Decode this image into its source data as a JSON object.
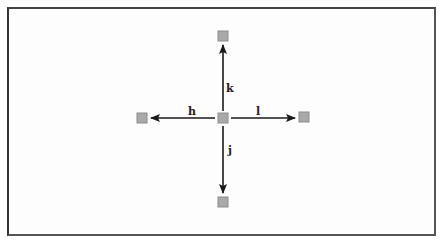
{
  "diagram": {
    "type": "cursor-movement-keys",
    "colors": {
      "arrow": "#1a1a1a",
      "node_fill": "#a9a9a9",
      "node_border": "#8c8c8c",
      "frame": "#555555"
    },
    "nodes": [
      {
        "id": "center",
        "x": 223,
        "y": 118
      },
      {
        "id": "up",
        "x": 223,
        "y": 36
      },
      {
        "id": "down",
        "x": 223,
        "y": 202
      },
      {
        "id": "left",
        "x": 142,
        "y": 118
      },
      {
        "id": "right",
        "x": 304,
        "y": 118
      }
    ],
    "arrows": [
      {
        "direction": "up",
        "key": "k"
      },
      {
        "direction": "down",
        "key": "j"
      },
      {
        "direction": "left",
        "key": "h"
      },
      {
        "direction": "right",
        "key": "l"
      }
    ],
    "labels": {
      "up": "k",
      "down": "j",
      "left": "h",
      "right": "l"
    }
  }
}
